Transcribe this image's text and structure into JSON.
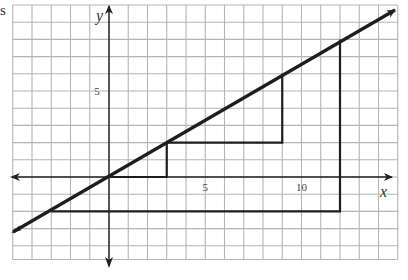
{
  "figure": {
    "corner_fragment": "s",
    "axes": {
      "x_label": "x",
      "y_label": "y",
      "x_ticks": [
        {
          "value": 5,
          "label": "5"
        },
        {
          "value": 10,
          "label": "10"
        }
      ],
      "y_ticks": [
        {
          "value": 5,
          "label": "5"
        }
      ]
    },
    "grid": {
      "x_min": -5,
      "x_max": 15,
      "y_min": -4.8,
      "y_max": 10,
      "step": 1
    },
    "line": {
      "equation": "y = (2/3)x",
      "slope": "2/3",
      "from": [
        -5,
        -3.2
      ],
      "to": [
        15,
        9.6
      ]
    },
    "triangles": [
      {
        "name": "small",
        "points": [
          [
            0,
            0
          ],
          [
            3,
            0
          ],
          [
            3,
            2
          ]
        ]
      },
      {
        "name": "medium",
        "points": [
          [
            3,
            2
          ],
          [
            9,
            2
          ],
          [
            9,
            6
          ]
        ]
      },
      {
        "name": "large",
        "points": [
          [
            -3,
            -2
          ],
          [
            12,
            -2
          ],
          [
            12,
            8
          ]
        ]
      }
    ],
    "colors": {
      "grid": "#b5b5b5",
      "axis": "#222222",
      "line": "#1e1e1e",
      "triangle": "#1e1e1e"
    }
  }
}
